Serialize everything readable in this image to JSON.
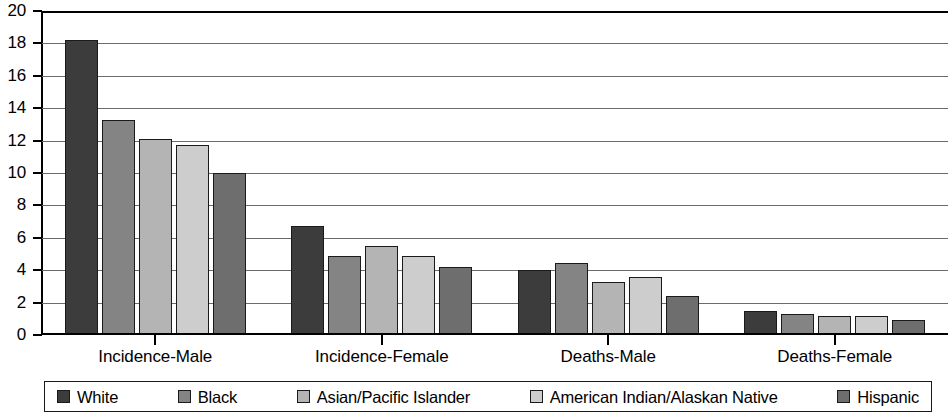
{
  "chart_data": {
    "type": "bar",
    "title": "",
    "subtitle": "",
    "xlabel": "",
    "ylabel": "",
    "ylim": [
      0,
      20
    ],
    "y_ticks": [
      0,
      2,
      4,
      6,
      8,
      10,
      12,
      14,
      16,
      18,
      20
    ],
    "y_tick_labels": [
      "0",
      "2",
      "4",
      "6",
      "8",
      "10",
      "12",
      "14",
      "16",
      "18",
      "20"
    ],
    "grid": true,
    "grid_axis": "y",
    "legend_position": "bottom",
    "categories": [
      "Incidence-Male",
      "Incidence-Female",
      "Deaths-Male",
      "Deaths-Female"
    ],
    "series": [
      {
        "name": "White",
        "color": "#3c3c3c",
        "values": [
          18.2,
          6.7,
          4.0,
          1.5
        ]
      },
      {
        "name": "Black",
        "color": "#848484",
        "values": [
          13.3,
          4.9,
          4.45,
          1.3
        ]
      },
      {
        "name": "Asian/Pacific Islander",
        "color": "#b4b4b4",
        "values": [
          12.1,
          5.5,
          3.3,
          1.2
        ]
      },
      {
        "name": "American Indian/Alaskan Native",
        "color": "#cdcdcd",
        "values": [
          11.7,
          4.9,
          3.6,
          1.2
        ]
      },
      {
        "name": "Hispanic",
        "color": "#6e6e6e",
        "values": [
          10.0,
          4.2,
          2.4,
          0.9
        ]
      }
    ]
  }
}
